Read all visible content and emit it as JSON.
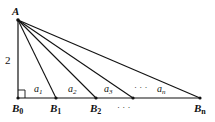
{
  "diagram": {
    "apex": {
      "label": "A",
      "x": 18,
      "y": 20
    },
    "height_label": "2",
    "right_angle_at": "B0",
    "baseline_y": 98,
    "points": [
      {
        "id": "B0",
        "label": "B",
        "sub": "0",
        "x": 18,
        "labeled": true
      },
      {
        "id": "B1",
        "label": "B",
        "sub": "1",
        "x": 56,
        "labeled": true
      },
      {
        "id": "B2",
        "label": "B",
        "sub": "2",
        "x": 96,
        "labeled": true
      },
      {
        "id": "B3",
        "label": "",
        "sub": "",
        "x": 133,
        "labeled": false
      },
      {
        "id": "Bn",
        "label": "B",
        "sub": "n",
        "x": 200,
        "labeled": true
      }
    ],
    "segments": [
      {
        "label": "a",
        "sub": "1",
        "x": 34
      },
      {
        "label": "a",
        "sub": "2",
        "x": 72
      },
      {
        "label": "a",
        "sub": "3",
        "x": 108
      },
      {
        "label": "a",
        "sub": "n",
        "x": 158
      }
    ],
    "segment_ellipsis": "· · ·",
    "point_ellipsis": "· · ·"
  }
}
